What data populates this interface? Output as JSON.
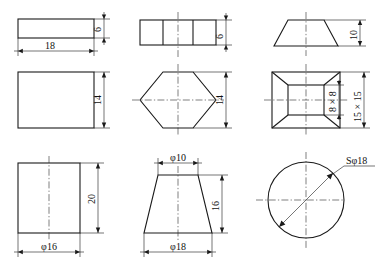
{
  "drawing": {
    "title": "Engineering orthographic views sheet",
    "background_color": "#ffffff",
    "line_color": "#1a1a1a",
    "views": [
      {
        "id": "plate-top-view",
        "name": "Rectangular plate - top view",
        "shape": "rectangle",
        "dimensions": [
          {
            "name": "plate-width",
            "label": "18",
            "orientation": "horizontal"
          },
          {
            "name": "plate-thickness",
            "label": "6",
            "orientation": "vertical"
          }
        ]
      },
      {
        "id": "plate-front-view",
        "name": "Rectangular plate - front view",
        "shape": "rectangle",
        "dimensions": [
          {
            "name": "plate-height",
            "label": "14",
            "orientation": "vertical"
          }
        ]
      },
      {
        "id": "cylinder-front-view",
        "name": "Cylinder - front view",
        "shape": "rectangle-with-centerline",
        "dimensions": [
          {
            "name": "cylinder-diameter",
            "label": "φ16",
            "orientation": "horizontal"
          },
          {
            "name": "cylinder-height",
            "label": "20",
            "orientation": "vertical"
          }
        ]
      },
      {
        "id": "hex-prism-top-view",
        "name": "Hexagonal prism - top view",
        "shape": "rectangle-divided-three",
        "dimensions": [
          {
            "name": "hex-prism-thickness",
            "label": "6",
            "orientation": "vertical"
          }
        ]
      },
      {
        "id": "hex-prism-front-view",
        "name": "Hexagonal prism - front view",
        "shape": "hexagon",
        "dimensions": [
          {
            "name": "hex-across-flats",
            "label": "14",
            "orientation": "vertical"
          }
        ]
      },
      {
        "id": "cone-frustum-front-view",
        "name": "Truncated cone - front view",
        "shape": "trapezoid-with-centerline",
        "dimensions": [
          {
            "name": "frustum-top-diameter",
            "label": "φ10",
            "orientation": "horizontal"
          },
          {
            "name": "frustum-bottom-diameter",
            "label": "φ18",
            "orientation": "horizontal"
          },
          {
            "name": "frustum-height",
            "label": "16",
            "orientation": "vertical"
          }
        ]
      },
      {
        "id": "pyramid-frustum-front-view",
        "name": "Truncated pyramid - front view",
        "shape": "trapezoid-with-centerline",
        "dimensions": [
          {
            "name": "pyramid-height",
            "label": "10",
            "orientation": "vertical"
          }
        ]
      },
      {
        "id": "pyramid-frustum-top-view",
        "name": "Truncated pyramid - top view",
        "shape": "nested-rectangles-with-diagonals",
        "dimensions": [
          {
            "name": "pyramid-top-square",
            "label": "8 × 8",
            "orientation": "vertical"
          },
          {
            "name": "pyramid-base-square",
            "label": "15 × 15",
            "orientation": "vertical"
          }
        ]
      },
      {
        "id": "sphere-view",
        "name": "Sphere - single view",
        "shape": "circle-with-centerlines",
        "dimensions": [
          {
            "name": "sphere-diameter",
            "label": "Sφ18",
            "orientation": "diagonal-leader"
          }
        ]
      }
    ]
  },
  "labels": {
    "plate_width": "18",
    "plate_thickness": "6",
    "plate_height": "14",
    "cylinder_diameter": "φ16",
    "cylinder_height": "20",
    "hex_prism_thickness": "6",
    "hex_across_flats": "14",
    "frustum_top_diameter": "φ10",
    "frustum_bottom_diameter": "φ18",
    "frustum_height": "16",
    "pyramid_height": "10",
    "pyramid_top_square": "8 × 8",
    "pyramid_base_square": "15 × 15",
    "sphere_diameter": "Sφ18"
  }
}
